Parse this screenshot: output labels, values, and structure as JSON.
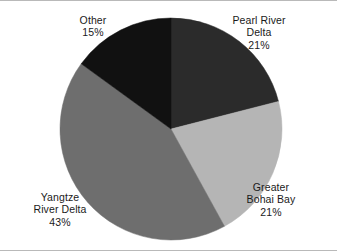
{
  "chart_data": {
    "type": "pie",
    "title": "",
    "subtitle": "",
    "xlabel": "",
    "ylabel": "",
    "legend_position": "none",
    "grid": false,
    "value_unit": "%",
    "categories": [
      "Pearl River Delta",
      "Greater Bohai Bay",
      "Yangtze River Delta",
      "Other"
    ],
    "values": [
      21,
      21,
      43,
      15
    ],
    "start_angle_deg": 0,
    "direction": "clockwise",
    "slices": [
      {
        "name": "Pearl River Delta",
        "value": 21,
        "value_text": "21%",
        "color": "#2b2b2b",
        "label_lines": [
          "Pearl River",
          "Delta",
          "21%"
        ],
        "label_position": "upper-right",
        "start_deg": 0,
        "end_deg": 75.6
      },
      {
        "name": "Greater Bohai Bay",
        "value": 21,
        "value_text": "21%",
        "color": "#b5b5b5",
        "label_lines": [
          "Greater",
          "Bohai Bay",
          "21%"
        ],
        "label_position": "lower-right",
        "start_deg": 75.6,
        "end_deg": 151.2
      },
      {
        "name": "Yangtze River Delta",
        "value": 43,
        "value_text": "43%",
        "color": "#6e6e6e",
        "label_lines": [
          "Yangtze",
          "River Delta",
          "43%"
        ],
        "label_position": "lower-left",
        "start_deg": 151.2,
        "end_deg": 306.0
      },
      {
        "name": "Other",
        "value": 15,
        "value_text": "15%",
        "color": "#111111",
        "label_lines": [
          "Other",
          "15%"
        ],
        "label_position": "upper-left",
        "start_deg": 306.0,
        "end_deg": 360.0
      }
    ]
  },
  "labels": {
    "pearl_river_delta": {
      "line1": "Pearl River",
      "line2": "Delta",
      "line3": "21%"
    },
    "greater_bohai_bay": {
      "line1": "Greater",
      "line2": "Bohai Bay",
      "line3": "21%"
    },
    "yangtze_river_delta": {
      "line1": "Yangtze",
      "line2": "River Delta",
      "line3": "43%"
    },
    "other": {
      "line1": "Other",
      "line2": "15%"
    }
  },
  "colors": {
    "pearl_river_delta": "#2b2b2b",
    "greater_bohai_bay": "#b5b5b5",
    "yangtze_river_delta": "#6e6e6e",
    "other": "#111111",
    "background": "#ffffff",
    "rule": "#b9b9b9",
    "text": "#1a1a1a"
  }
}
